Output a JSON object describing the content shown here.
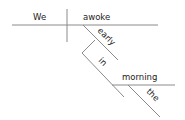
{
  "diagram": {
    "type": "sentence-diagram",
    "sentence": "We awoke early in the morning",
    "subject": "We",
    "verb": "awoke",
    "modifiers": [
      {
        "word": "early",
        "role": "adverb",
        "modifies": "awoke"
      },
      {
        "word": "in",
        "role": "preposition",
        "modifies": "awoke"
      },
      {
        "word": "morning",
        "role": "object-of-preposition"
      },
      {
        "word": "the",
        "role": "article",
        "modifies": "morning"
      }
    ],
    "colors": {
      "line": "#8a8a8a",
      "text": "#222222",
      "background": "#ffffff"
    }
  }
}
